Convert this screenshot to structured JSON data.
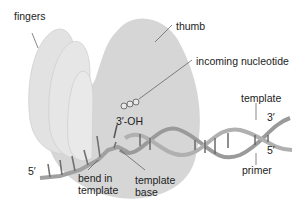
{
  "diagram": {
    "labels": {
      "fingers": "fingers",
      "thumb": "thumb",
      "incoming_nucleotide": "incoming nucleotide",
      "template_top": "template",
      "three_prime_top": "3′",
      "five_prime_right": "5′",
      "primer": "primer",
      "three_oh": "3′-OH",
      "five_prime_left": "5′",
      "bend_line1": "bend in",
      "bend_line2": "template",
      "template_base_line1": "template",
      "template_base_line2": "base"
    },
    "nucleotide_phosphates": "PPP",
    "colors": {
      "protein": "#dadada",
      "protein_edge": "#c8c8c8",
      "dna_backbone": "#9a9a9a",
      "base_pairs": "#6a6a6a"
    }
  }
}
